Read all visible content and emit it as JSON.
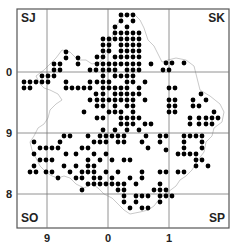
{
  "map": {
    "frame": {
      "x": 17,
      "y": 9,
      "w": 212,
      "h": 219
    },
    "grid": {
      "vertical_x": [
        47,
        108,
        169
      ],
      "horizontal_y": [
        72,
        133,
        194
      ]
    },
    "corner_labels": {
      "top_left": "SJ",
      "top_right": "SK",
      "bottom_left": "SO",
      "bottom_right": "SP"
    },
    "left_ticks": [
      {
        "label": "0",
        "y": 72
      },
      {
        "label": "9",
        "y": 133
      },
      {
        "label": "8",
        "y": 194
      }
    ],
    "bottom_ticks": [
      {
        "label": "9",
        "x": 47
      },
      {
        "label": "0",
        "x": 108
      },
      {
        "label": "1",
        "x": 169
      }
    ],
    "dot_color": "#000000",
    "boundary_color": "#bbbbbb",
    "grid_color": "#777777",
    "dots": [
      [
        66,
        52
      ],
      [
        66,
        58
      ],
      [
        78,
        58
      ],
      [
        78,
        64
      ],
      [
        54,
        64
      ],
      [
        60,
        64
      ],
      [
        54,
        70
      ],
      [
        60,
        70
      ],
      [
        54,
        76
      ],
      [
        48,
        76
      ],
      [
        42,
        76
      ],
      [
        42,
        82
      ],
      [
        36,
        82
      ],
      [
        30,
        82
      ],
      [
        24,
        82
      ],
      [
        48,
        82
      ],
      [
        30,
        88
      ],
      [
        24,
        88
      ],
      [
        90,
        70
      ],
      [
        96,
        70
      ],
      [
        90,
        82
      ],
      [
        72,
        88
      ],
      [
        78,
        88
      ],
      [
        84,
        88
      ],
      [
        90,
        88
      ],
      [
        66,
        88
      ],
      [
        66,
        82
      ],
      [
        96,
        94
      ],
      [
        90,
        100
      ],
      [
        84,
        112
      ],
      [
        121,
        15
      ],
      [
        127,
        15
      ],
      [
        133,
        15
      ],
      [
        121,
        21
      ],
      [
        133,
        21
      ],
      [
        127,
        27
      ],
      [
        103,
        39
      ],
      [
        109,
        39
      ],
      [
        115,
        33
      ],
      [
        121,
        33
      ],
      [
        127,
        33
      ],
      [
        133,
        33
      ],
      [
        139,
        33
      ],
      [
        103,
        45
      ],
      [
        109,
        45
      ],
      [
        115,
        39
      ],
      [
        121,
        39
      ],
      [
        127,
        39
      ],
      [
        133,
        39
      ],
      [
        139,
        39
      ],
      [
        121,
        45
      ],
      [
        127,
        45
      ],
      [
        133,
        45
      ],
      [
        139,
        45
      ],
      [
        115,
        27
      ],
      [
        103,
        51
      ],
      [
        109,
        51
      ],
      [
        121,
        51
      ],
      [
        127,
        51
      ],
      [
        133,
        51
      ],
      [
        139,
        51
      ],
      [
        97,
        57
      ],
      [
        103,
        57
      ],
      [
        115,
        57
      ],
      [
        121,
        57
      ],
      [
        127,
        57
      ],
      [
        133,
        57
      ],
      [
        139,
        57
      ],
      [
        97,
        64
      ],
      [
        103,
        64
      ],
      [
        109,
        64
      ],
      [
        115,
        64
      ],
      [
        121,
        64
      ],
      [
        127,
        64
      ],
      [
        133,
        64
      ],
      [
        139,
        64
      ],
      [
        151,
        64
      ],
      [
        103,
        70
      ],
      [
        109,
        70
      ],
      [
        115,
        70
      ],
      [
        127,
        70
      ],
      [
        133,
        70
      ],
      [
        139,
        70
      ],
      [
        163,
        70
      ],
      [
        169,
        70
      ],
      [
        103,
        76
      ],
      [
        115,
        76
      ],
      [
        121,
        76
      ],
      [
        127,
        76
      ],
      [
        133,
        76
      ],
      [
        97,
        82
      ],
      [
        103,
        82
      ],
      [
        109,
        82
      ],
      [
        127,
        82
      ],
      [
        133,
        82
      ],
      [
        145,
        82
      ],
      [
        103,
        88
      ],
      [
        109,
        88
      ],
      [
        115,
        88
      ],
      [
        121,
        88
      ],
      [
        127,
        88
      ],
      [
        139,
        88
      ],
      [
        169,
        88
      ],
      [
        175,
        88
      ],
      [
        103,
        94
      ],
      [
        115,
        94
      ],
      [
        121,
        94
      ],
      [
        127,
        94
      ],
      [
        133,
        94
      ],
      [
        139,
        94
      ],
      [
        97,
        100
      ],
      [
        103,
        100
      ],
      [
        109,
        100
      ],
      [
        115,
        100
      ],
      [
        121,
        100
      ],
      [
        127,
        100
      ],
      [
        133,
        100
      ],
      [
        145,
        100
      ],
      [
        97,
        106
      ],
      [
        103,
        106
      ],
      [
        115,
        106
      ],
      [
        127,
        106
      ],
      [
        133,
        106
      ],
      [
        109,
        112
      ],
      [
        115,
        112
      ],
      [
        121,
        112
      ],
      [
        133,
        112
      ],
      [
        97,
        118
      ],
      [
        103,
        118
      ],
      [
        121,
        118
      ],
      [
        127,
        118
      ],
      [
        133,
        118
      ],
      [
        139,
        118
      ],
      [
        121,
        124
      ],
      [
        127,
        124
      ],
      [
        133,
        124
      ],
      [
        145,
        124
      ],
      [
        151,
        124
      ],
      [
        103,
        130
      ],
      [
        115,
        130
      ],
      [
        127,
        130
      ],
      [
        139,
        130
      ],
      [
        166,
        63
      ],
      [
        172,
        63
      ],
      [
        184,
        63
      ],
      [
        169,
        100
      ],
      [
        175,
        100
      ],
      [
        193,
        100
      ],
      [
        201,
        94
      ],
      [
        206,
        100
      ],
      [
        169,
        106
      ],
      [
        175,
        106
      ],
      [
        193,
        106
      ],
      [
        199,
        106
      ],
      [
        214,
        112
      ],
      [
        169,
        112
      ],
      [
        175,
        112
      ],
      [
        190,
        118
      ],
      [
        199,
        118
      ],
      [
        206,
        118
      ],
      [
        212,
        118
      ],
      [
        218,
        118
      ],
      [
        190,
        124
      ],
      [
        199,
        124
      ],
      [
        206,
        124
      ],
      [
        212,
        124
      ],
      [
        146,
        136
      ],
      [
        160,
        136
      ],
      [
        166,
        136
      ],
      [
        184,
        136
      ],
      [
        190,
        136
      ],
      [
        196,
        136
      ],
      [
        202,
        136
      ],
      [
        184,
        142
      ],
      [
        202,
        142
      ],
      [
        184,
        148
      ],
      [
        202,
        148
      ],
      [
        184,
        154
      ],
      [
        190,
        154
      ],
      [
        196,
        154
      ],
      [
        142,
        142
      ],
      [
        160,
        142
      ],
      [
        148,
        148
      ],
      [
        166,
        150
      ],
      [
        178,
        154
      ],
      [
        100,
        136
      ],
      [
        106,
        136
      ],
      [
        112,
        136
      ],
      [
        118,
        136
      ],
      [
        124,
        136
      ],
      [
        88,
        136
      ],
      [
        94,
        142
      ],
      [
        100,
        142
      ],
      [
        106,
        142
      ],
      [
        118,
        142
      ],
      [
        124,
        142
      ],
      [
        70,
        136
      ],
      [
        64,
        136
      ],
      [
        58,
        148
      ],
      [
        52,
        148
      ],
      [
        60,
        142
      ],
      [
        46,
        148
      ],
      [
        34,
        142
      ],
      [
        34,
        154
      ],
      [
        40,
        148
      ],
      [
        66,
        154
      ],
      [
        82,
        148
      ],
      [
        88,
        148
      ],
      [
        76,
        154
      ],
      [
        94,
        154
      ],
      [
        106,
        154
      ],
      [
        88,
        160
      ],
      [
        100,
        160
      ],
      [
        112,
        160
      ],
      [
        124,
        160
      ],
      [
        130,
        160
      ],
      [
        40,
        160
      ],
      [
        46,
        160
      ],
      [
        52,
        160
      ],
      [
        64,
        166
      ],
      [
        76,
        166
      ],
      [
        88,
        166
      ],
      [
        94,
        166
      ],
      [
        34,
        166
      ],
      [
        30,
        172
      ],
      [
        36,
        172
      ],
      [
        46,
        172
      ],
      [
        52,
        172
      ],
      [
        58,
        178
      ],
      [
        70,
        172
      ],
      [
        82,
        172
      ],
      [
        88,
        172
      ],
      [
        94,
        172
      ],
      [
        106,
        172
      ],
      [
        118,
        172
      ],
      [
        142,
        172
      ],
      [
        76,
        178
      ],
      [
        82,
        178
      ],
      [
        94,
        178
      ],
      [
        100,
        178
      ],
      [
        112,
        178
      ],
      [
        130,
        178
      ],
      [
        142,
        178
      ],
      [
        160,
        172
      ],
      [
        166,
        172
      ],
      [
        100,
        184
      ],
      [
        106,
        184
      ],
      [
        112,
        184
      ],
      [
        118,
        184
      ],
      [
        124,
        184
      ],
      [
        136,
        184
      ],
      [
        160,
        184
      ],
      [
        118,
        190
      ],
      [
        124,
        190
      ],
      [
        154,
        190
      ],
      [
        160,
        190
      ],
      [
        166,
        190
      ],
      [
        82,
        190
      ],
      [
        88,
        184
      ],
      [
        94,
        184
      ],
      [
        124,
        196
      ],
      [
        136,
        196
      ],
      [
        142,
        196
      ],
      [
        148,
        196
      ],
      [
        160,
        196
      ],
      [
        166,
        196
      ],
      [
        172,
        196
      ],
      [
        124,
        202
      ],
      [
        136,
        202
      ],
      [
        160,
        202
      ],
      [
        130,
        208
      ],
      [
        142,
        208
      ],
      [
        148,
        208
      ],
      [
        196,
        160
      ],
      [
        202,
        160
      ],
      [
        196,
        166
      ],
      [
        208,
        166
      ],
      [
        178,
        172
      ],
      [
        184,
        172
      ]
    ],
    "boundary_path": "M40 84 L36 76 L44 70 L50 64 L56 58 L62 50 L70 52 L78 60 L86 60 L92 64 L100 62 L104 56 L110 46 L114 30 L120 20 L126 14 L134 14 L140 20 L144 28 L148 40 L154 46 L158 54 L162 62 L168 60 L176 58 L186 60 L194 66 L196 74 L198 82 L200 90 L210 96 L220 104 L224 112 L222 122 L214 128 L212 136 L206 142 L204 152 L198 160 L192 170 L186 176 L180 180 L176 186 L168 192 L160 198 L154 206 L148 210 L140 212 L130 214 L124 210 L118 204 L112 198 L104 194 L98 188 L92 184 L84 188 L76 184 L70 178 L64 176 L58 178 L52 176 L46 172 L40 166 L36 158 L32 150 L30 142 L34 136 L38 128 L44 124 L48 118 L50 110 L56 104 L62 100 L58 94 L50 90 L44 88 Z"
  }
}
